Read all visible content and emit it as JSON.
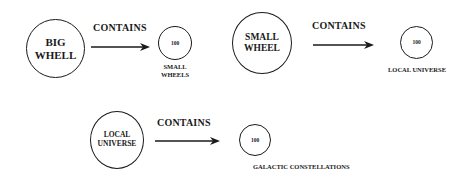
{
  "diagram": {
    "rows": [
      {
        "source": {
          "line1": "BIG",
          "line2": "WHELL"
        },
        "relation": "CONTAINS",
        "target": {
          "count": "100",
          "label_line1": "SMALL",
          "label_line2": "WHEELS"
        }
      },
      {
        "source": {
          "line1": "SMALL",
          "line2": "WHEEL"
        },
        "relation": "CONTAINS",
        "target": {
          "count": "100",
          "label": "LOCAL UNIVERSE"
        }
      },
      {
        "source": {
          "line1": "LOCAL",
          "line2": "UNIVERSE"
        },
        "relation": "CONTAINS",
        "target": {
          "count": "100",
          "label": "GALACTIC CONSTELLATIONS"
        }
      }
    ]
  }
}
